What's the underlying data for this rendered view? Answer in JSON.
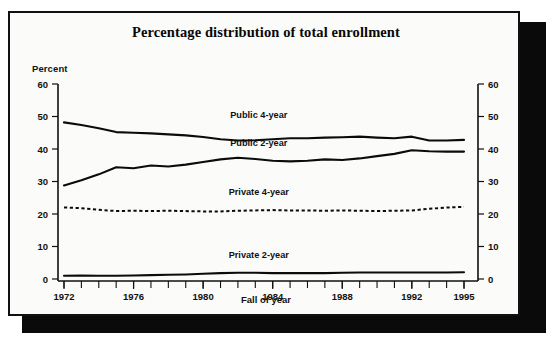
{
  "chart_data": {
    "type": "line",
    "title": "Percentage distribution of total enrollment",
    "xlabel": "Fall of year",
    "ylabel": "Percent",
    "ylabel_right": "",
    "grid": false,
    "legend_position": "inline-right",
    "xlim": [
      1972,
      1995
    ],
    "ylim": [
      0,
      60
    ],
    "ytick_labels": [
      "0",
      "10",
      "20",
      "30",
      "40",
      "50",
      "60"
    ],
    "ytick_values": [
      0,
      10,
      20,
      30,
      40,
      50,
      60
    ],
    "ytick_labels_right": [
      "0",
      "10",
      "20",
      "30",
      "40",
      "50",
      "60"
    ],
    "xtick_labels": [
      "1972",
      "1976",
      "1980",
      "1984",
      "1988",
      "1992",
      "1995"
    ],
    "xtick_values": [
      1972,
      1976,
      1980,
      1984,
      1988,
      1992,
      1995
    ],
    "x": [
      1972,
      1973,
      1974,
      1975,
      1976,
      1977,
      1978,
      1979,
      1980,
      1981,
      1982,
      1983,
      1984,
      1985,
      1986,
      1987,
      1988,
      1989,
      1990,
      1991,
      1992,
      1993,
      1994,
      1995
    ],
    "series": [
      {
        "name": "Public 4-year",
        "style": "solid",
        "color": "#0b0b0b",
        "label_x": 1983.2,
        "label_y": 49.5,
        "values": [
          48.2,
          47.4,
          46.4,
          45.2,
          45.0,
          44.8,
          44.5,
          44.2,
          43.7,
          43.0,
          42.6,
          42.7,
          43.0,
          43.3,
          43.3,
          43.5,
          43.6,
          43.8,
          43.5,
          43.3,
          43.8,
          42.6,
          42.6,
          42.8
        ]
      },
      {
        "name": "Public 2-year",
        "style": "solid",
        "color": "#0b0b0b",
        "label_x": 1983.2,
        "label_y": 41.0,
        "values": [
          28.8,
          30.4,
          32.2,
          34.4,
          34.1,
          34.9,
          34.6,
          35.2,
          36.0,
          36.8,
          37.3,
          36.9,
          36.4,
          36.2,
          36.4,
          36.8,
          36.6,
          37.1,
          37.8,
          38.5,
          39.6,
          39.3,
          39.2,
          39.2
        ]
      },
      {
        "name": "Private 4-year",
        "style": "dashed",
        "color": "#0b0b0b",
        "label_x": 1983.2,
        "label_y": 25.8,
        "values": [
          22.0,
          21.8,
          21.3,
          20.9,
          21.0,
          20.9,
          21.0,
          20.9,
          20.8,
          20.8,
          21.0,
          21.1,
          21.2,
          21.1,
          21.1,
          21.0,
          21.1,
          21.0,
          20.9,
          21.0,
          21.1,
          21.6,
          22.0,
          22.2
        ]
      },
      {
        "name": "Private 2-year",
        "style": "solid",
        "color": "#0b0b0b",
        "label_x": 1983.2,
        "label_y": 6.5,
        "values": [
          1.0,
          1.1,
          1.0,
          1.0,
          1.1,
          1.2,
          1.3,
          1.4,
          1.6,
          1.8,
          1.9,
          1.9,
          1.8,
          1.8,
          1.8,
          1.8,
          1.9,
          2.0,
          2.0,
          2.0,
          2.0,
          2.0,
          2.0,
          2.1
        ]
      }
    ]
  }
}
